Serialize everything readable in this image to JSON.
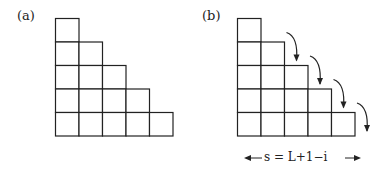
{
  "panels": [
    {
      "id": "a",
      "label": "(a)",
      "rows": [
        1,
        2,
        3,
        4,
        5
      ],
      "filled_cells": []
    },
    {
      "id": "b",
      "label": "(b)",
      "rows": [
        1,
        2,
        3,
        4,
        5
      ],
      "filled_cells": [
        [
          0,
          1
        ]
      ],
      "arrows": 4,
      "annotation": {
        "left_arrow": "←",
        "text": "s = L+1−i",
        "right_arrow": "→"
      }
    }
  ],
  "colors": {
    "line": "#222222",
    "fill": "#000000",
    "background": "#ffffff"
  }
}
